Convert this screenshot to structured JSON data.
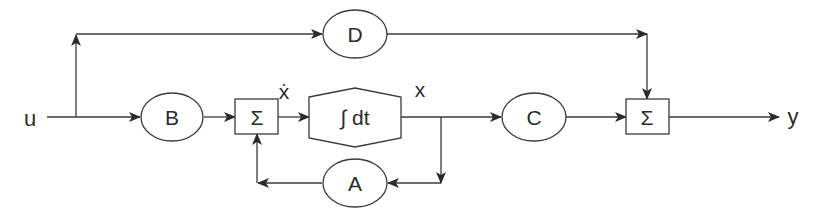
{
  "diagram": {
    "type": "state-space block diagram",
    "signals": {
      "input": "u",
      "output": "y",
      "state": "x",
      "state_derivative": "ẋ"
    },
    "blocks": {
      "B": "B",
      "A": "A",
      "C": "C",
      "D": "D",
      "integrator": "∫ dt",
      "sum1": "Σ",
      "sum2": "Σ"
    },
    "colors": {
      "stroke": "#3a3a3a",
      "background": "#ffffff"
    }
  }
}
